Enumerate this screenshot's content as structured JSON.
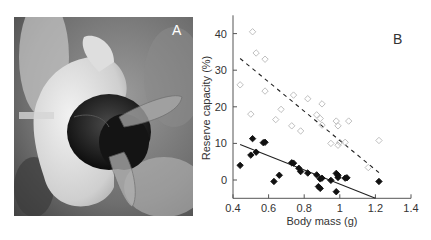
{
  "panels": {
    "a": {
      "label": "A",
      "content": "photo of a carpenter bee on a white flower"
    },
    "b": {
      "label": "B"
    }
  },
  "colors": {
    "open_marker": "#b8b8b8",
    "filled_marker": "#111111",
    "axis": "#555555"
  },
  "chart_data": {
    "type": "scatter",
    "title": "",
    "xlabel": "Body mass (g)",
    "ylabel": "Reserve capacity (%)",
    "xlim": [
      0.4,
      1.4
    ],
    "ylim": [
      -5,
      45
    ],
    "xticks": [
      "0.4",
      "0.6",
      "0.8",
      "1",
      "1.2",
      "1.4"
    ],
    "yticks": [
      "0",
      "10",
      "20",
      "30",
      "40"
    ],
    "grid": false,
    "legend": null,
    "series": [
      {
        "name": "open diamonds",
        "marker": "open-diamond",
        "points": [
          [
            0.51,
            40.5
          ],
          [
            0.53,
            34.7
          ],
          [
            0.58,
            33.0
          ],
          [
            0.44,
            26.0
          ],
          [
            0.58,
            24.3
          ],
          [
            0.5,
            18.0
          ],
          [
            0.64,
            16.5
          ],
          [
            0.67,
            19.3
          ],
          [
            0.73,
            14.8
          ],
          [
            0.74,
            23.2
          ],
          [
            0.78,
            13.4
          ],
          [
            0.82,
            22.2
          ],
          [
            0.87,
            17.8
          ],
          [
            0.89,
            16.8
          ],
          [
            0.9,
            15.0
          ],
          [
            0.9,
            20.8
          ],
          [
            0.95,
            10.0
          ],
          [
            0.98,
            16.1
          ],
          [
            0.99,
            14.8
          ],
          [
            0.99,
            9.5
          ],
          [
            1.0,
            10.3
          ],
          [
            1.03,
            10.3
          ],
          [
            1.05,
            16.1
          ],
          [
            1.16,
            3.4
          ],
          [
            1.22,
            10.8
          ]
        ],
        "fit": {
          "style": "dashed",
          "x": [
            0.44,
            1.22
          ],
          "y": [
            33.2,
            2.0
          ]
        }
      },
      {
        "name": "filled diamonds",
        "marker": "filled-diamond",
        "points": [
          [
            0.44,
            4.0
          ],
          [
            0.5,
            6.8
          ],
          [
            0.51,
            11.3
          ],
          [
            0.53,
            7.6
          ],
          [
            0.57,
            10.2
          ],
          [
            0.58,
            10.3
          ],
          [
            0.63,
            -0.4
          ],
          [
            0.66,
            1.3
          ],
          [
            0.73,
            4.7
          ],
          [
            0.74,
            4.6
          ],
          [
            0.77,
            3.2
          ],
          [
            0.78,
            2.3
          ],
          [
            0.82,
            1.9
          ],
          [
            0.87,
            1.4
          ],
          [
            0.88,
            -1.8
          ],
          [
            0.89,
            -2.3
          ],
          [
            0.89,
            0.3
          ],
          [
            0.9,
            0.5
          ],
          [
            0.95,
            -0.1
          ],
          [
            0.98,
            -3.2
          ],
          [
            0.98,
            1.8
          ],
          [
            0.99,
            0.7
          ],
          [
            0.99,
            1.3
          ],
          [
            1.03,
            0.5
          ],
          [
            1.04,
            0.6
          ],
          [
            1.22,
            -0.4
          ]
        ],
        "fit": {
          "style": "solid",
          "x": [
            0.44,
            1.2
          ],
          "y": [
            9.7,
            -5.0
          ]
        }
      }
    ]
  }
}
